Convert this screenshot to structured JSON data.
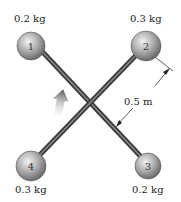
{
  "diagram": {
    "masses": [
      {
        "id": "1",
        "label": "1",
        "mass": "0.2 kg",
        "position": "top-left"
      },
      {
        "id": "2",
        "label": "2",
        "mass": "0.3 kg",
        "position": "top-right"
      },
      {
        "id": "3",
        "label": "3",
        "mass": "0.2 kg",
        "position": "bottom-right"
      },
      {
        "id": "4",
        "label": "4",
        "mass": "0.3 kg",
        "position": "bottom-left"
      }
    ],
    "dimension": "0.5 m",
    "rods": [
      "rod 1-3",
      "rod 2-4"
    ],
    "rotation_arrow": "curved-arrow"
  }
}
